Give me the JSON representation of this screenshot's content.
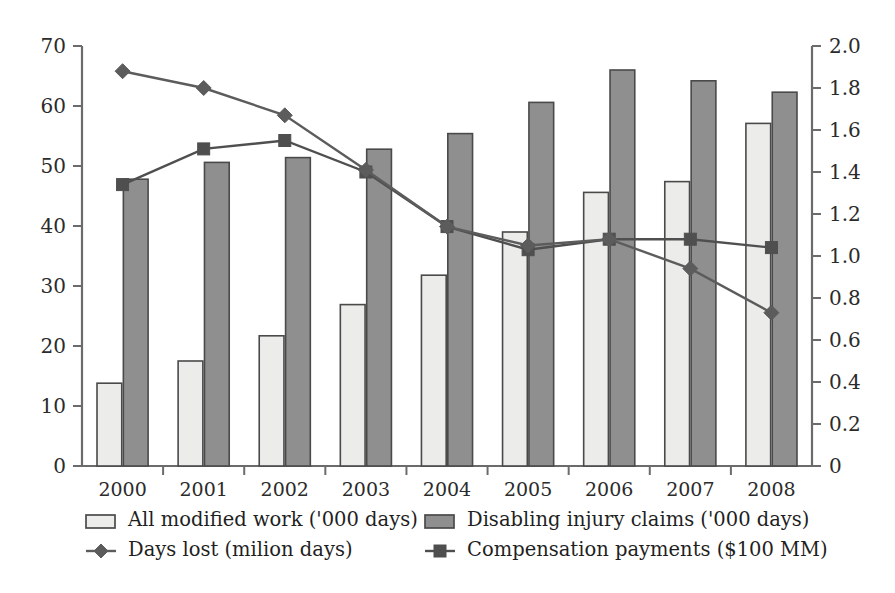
{
  "chart_data": {
    "type": "bar",
    "title": "",
    "subtitle": "",
    "xlabel": "",
    "ylabel": "",
    "y2label": "",
    "grid": false,
    "legend_position": "bottom",
    "categories": [
      "2000",
      "2001",
      "2002",
      "2003",
      "2004",
      "2005",
      "2006",
      "2007",
      "2008"
    ],
    "ylim": [
      0,
      70
    ],
    "yticks": [
      "0",
      "10",
      "20",
      "30",
      "40",
      "50",
      "60",
      "70"
    ],
    "y2lim": [
      0,
      2.0
    ],
    "y2ticks": [
      "0",
      "0.2",
      "0.4",
      "0.6",
      "0.8",
      "1.0",
      "1.2",
      "1.4",
      "1.6",
      "1.8",
      "2.0"
    ],
    "series": [
      {
        "name": "All modified work ('000 days)",
        "kind": "bar",
        "axis": "left",
        "fill": "#ececea",
        "stroke": "#4a4a4a",
        "values": [
          13.8,
          17.5,
          21.7,
          26.9,
          31.8,
          39.0,
          45.6,
          47.4,
          57.1
        ]
      },
      {
        "name": "Disabling injury claims ('000 days)",
        "kind": "bar",
        "axis": "left",
        "fill": "#8f8f8f",
        "stroke": "#4a4a4a",
        "values": [
          47.8,
          50.6,
          51.4,
          52.8,
          55.4,
          60.6,
          66.0,
          64.2,
          62.3
        ]
      },
      {
        "name": "Days lost (milion days)",
        "kind": "line",
        "axis": "right",
        "marker": "diamond",
        "stroke": "#5c5c5c",
        "values": [
          1.88,
          1.8,
          1.67,
          1.41,
          1.14,
          1.05,
          1.08,
          0.94,
          0.73
        ]
      },
      {
        "name": "Compensation payments ($100 MM)",
        "kind": "line",
        "axis": "right",
        "marker": "square",
        "stroke": "#4f4f4f",
        "values": [
          1.34,
          1.51,
          1.55,
          1.4,
          1.14,
          1.03,
          1.08,
          1.08,
          1.04
        ]
      }
    ]
  },
  "legend": {
    "items": [
      {
        "label": "All modified work ('000 days)",
        "marker": "bar-light-swatch"
      },
      {
        "label": "Disabling injury claims ('000 days)",
        "marker": "bar-dark-swatch"
      },
      {
        "label": "Days lost (milion days)",
        "marker": "line-diamond-swatch"
      },
      {
        "label": "Compensation payments ($100 MM)",
        "marker": "line-square-swatch"
      }
    ]
  },
  "colors": {
    "bar_light_fill": "#ececea",
    "bar_dark_fill": "#8f8f8f",
    "outline": "#4a4a4a",
    "line_days_lost": "#5c5c5c",
    "line_compensation": "#4f4f4f",
    "text": "#1f1f1f",
    "axis": "#6b6b6b"
  }
}
